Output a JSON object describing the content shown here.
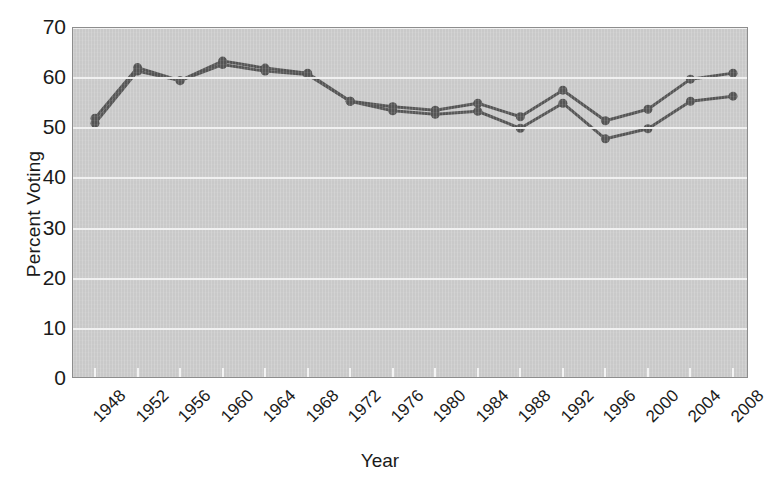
{
  "chart_data": {
    "type": "line",
    "title": "",
    "xlabel": "Year",
    "ylabel": "Percent Voting",
    "x": [
      1948,
      1952,
      1956,
      1960,
      1964,
      1968,
      1972,
      1976,
      1980,
      1984,
      1988,
      1992,
      1996,
      2000,
      2004,
      2008
    ],
    "categories": [
      "1948",
      "1952",
      "1956",
      "1960",
      "1964",
      "1968",
      "1972",
      "1976",
      "1980",
      "1984",
      "1988",
      "1992",
      "1996",
      "2000",
      "2004",
      "2008"
    ],
    "series": [
      {
        "name": "upper-series",
        "color": "#545454",
        "values": [
          52.0,
          62.1,
          59.5,
          63.4,
          62.0,
          61.0,
          55.4,
          54.3,
          53.6,
          55.0,
          52.3,
          57.6,
          51.5,
          53.8,
          59.8,
          61.0
        ]
      },
      {
        "name": "lower-series",
        "color": "#545454",
        "values": [
          51.0,
          61.4,
          59.5,
          62.7,
          61.4,
          60.7,
          55.4,
          53.5,
          52.8,
          53.4,
          50.0,
          55.0,
          47.9,
          49.9,
          55.4,
          56.4
        ]
      }
    ],
    "ylim": [
      0,
      70
    ],
    "ytick_values": [
      70,
      60,
      50,
      40,
      30,
      20,
      10,
      0
    ],
    "ytick_labels": [
      "70",
      "60",
      "50",
      "40",
      "30",
      "20",
      "10",
      "0"
    ],
    "grid": true,
    "grid_axis": "y",
    "legend": false,
    "legend_position": "none",
    "plot_background": "#c9c9c9",
    "gridline_color": "#f2f2f2",
    "line_color": "#545454",
    "marker": "circle",
    "marker_size": 9
  }
}
